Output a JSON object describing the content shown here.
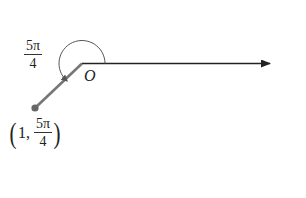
{
  "diagram": {
    "type": "polar-coordinate-point",
    "origin_label": "O",
    "angle_label": {
      "numerator": "5π",
      "denominator": "4"
    },
    "point_label": {
      "open": "(",
      "r": "1",
      "sep": ",",
      "numerator": "5π",
      "denominator": "4",
      "close": ")"
    },
    "colors": {
      "polar_axis": "#222222",
      "ray": "#777777",
      "point": "#666666",
      "arc": "#555555"
    },
    "geometry": {
      "origin": [
        82,
        63
      ],
      "axis_end": [
        272,
        64
      ],
      "point": [
        35,
        108
      ],
      "arc_radius": 23
    }
  }
}
